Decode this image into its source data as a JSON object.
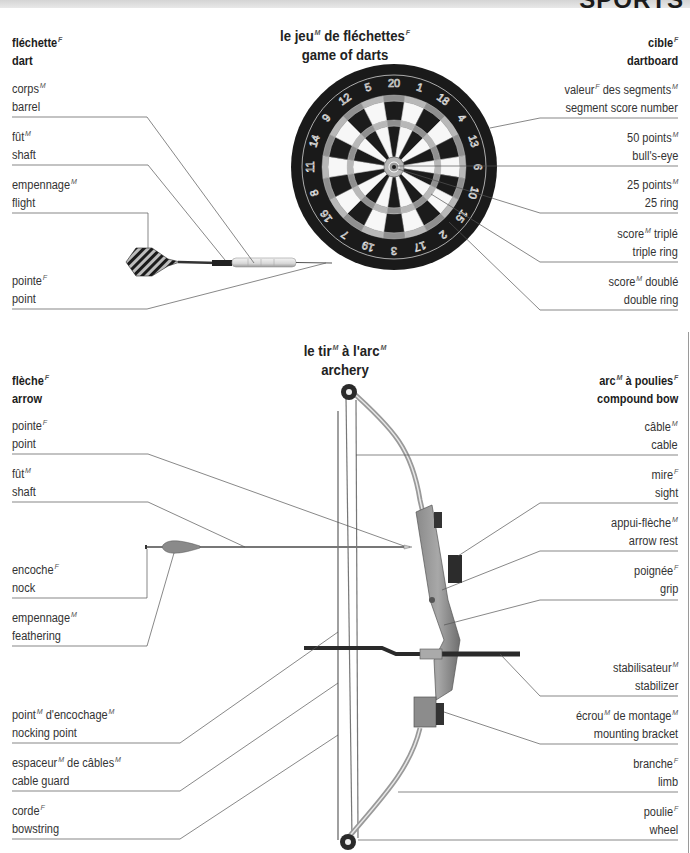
{
  "chapter": {
    "title": "SPORTS"
  },
  "darts": {
    "title_fr": "le jeu",
    "title_fr_g1": "M",
    "title_fr_mid": " de fléchettes",
    "title_fr_g2": "F",
    "title_en": "game of darts",
    "dart": {
      "header": {
        "fr": "fléchette",
        "g": "F",
        "en": "dart"
      },
      "parts": [
        {
          "fr": "corps",
          "g": "M",
          "en": "barrel"
        },
        {
          "fr": "fût",
          "g": "M",
          "en": "shaft"
        },
        {
          "fr": "empennage",
          "g": "M",
          "en": "flight"
        },
        {
          "fr": "pointe",
          "g": "F",
          "en": "point"
        }
      ]
    },
    "dartboard": {
      "header": {
        "fr": "cible",
        "g": "F",
        "en": "dartboard"
      },
      "parts": [
        {
          "fr": "valeur",
          "g": "F",
          "fr2": " des segments",
          "g2": "M",
          "en": "segment score number"
        },
        {
          "fr": "50 points",
          "g": "M",
          "en": "bull's-eye"
        },
        {
          "fr": "25 points",
          "g": "M",
          "en": "25 ring"
        },
        {
          "fr": "score",
          "g": "M",
          "fr2": " triplé",
          "en": "triple ring"
        },
        {
          "fr": "score",
          "g": "M",
          "fr2": " doublé",
          "en": "double ring"
        }
      ],
      "numbers": [
        "20",
        "1",
        "18",
        "4",
        "13",
        "6",
        "10",
        "15",
        "2",
        "17",
        "3",
        "19",
        "7",
        "16",
        "8",
        "11",
        "14",
        "9",
        "12",
        "5"
      ]
    }
  },
  "archery": {
    "title_fr": "le tir",
    "title_fr_g1": "M",
    "title_fr_mid": " à l'arc",
    "title_fr_g2": "M",
    "title_en": "archery",
    "arrow": {
      "header": {
        "fr": "flèche",
        "g": "F",
        "en": "arrow"
      },
      "parts": [
        {
          "fr": "pointe",
          "g": "F",
          "en": "point"
        },
        {
          "fr": "fût",
          "g": "M",
          "en": "shaft"
        },
        {
          "fr": "encoche",
          "g": "F",
          "en": "nock"
        },
        {
          "fr": "empennage",
          "g": "M",
          "en": "feathering"
        },
        {
          "fr": "point",
          "g": "M",
          "fr2": " d'encochage",
          "g2": "M",
          "en": "nocking point"
        },
        {
          "fr": "espaceur",
          "g": "M",
          "fr2": " de câbles",
          "g2": "M",
          "en": "cable guard"
        },
        {
          "fr": "corde",
          "g": "F",
          "en": "bowstring"
        }
      ]
    },
    "bow": {
      "header": {
        "fr": "arc",
        "g": "M",
        "fr2": " à poulies",
        "g2": "F",
        "en": "compound bow"
      },
      "parts": [
        {
          "fr": "câble",
          "g": "M",
          "en": "cable"
        },
        {
          "fr": "mire",
          "g": "F",
          "en": "sight"
        },
        {
          "fr": "appui-flèche",
          "g": "M",
          "en": "arrow rest"
        },
        {
          "fr": "poignée",
          "g": "F",
          "en": "grip"
        },
        {
          "fr": "stabilisateur",
          "g": "M",
          "en": "stabilizer"
        },
        {
          "fr": "écrou",
          "g": "M",
          "fr2": " de montage",
          "g2": "M",
          "en": "mounting bracket"
        },
        {
          "fr": "branche",
          "g": "F",
          "en": "limb"
        },
        {
          "fr": "poulie",
          "g": "F",
          "en": "wheel"
        }
      ]
    }
  }
}
